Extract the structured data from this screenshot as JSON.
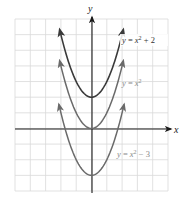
{
  "chart_data": {
    "type": "line",
    "title": "",
    "xlabel": "x",
    "ylabel": "y",
    "xlim": [
      -5,
      5
    ],
    "ylim": [
      -4,
      7
    ],
    "grid": true,
    "grid_step": 1,
    "legend_position": "inline labels right of curves",
    "series": [
      {
        "name": "y = x^2 + 2",
        "label": "y = x² + 2",
        "formula": "x^2 + 2",
        "shift": 2,
        "x_range": [
          -2.07,
          2.07
        ],
        "vertex": [
          0,
          2
        ],
        "color": "#3a3a3a",
        "label_color": "#333333",
        "x": [
          -2,
          -1.5,
          -1,
          -0.5,
          0,
          0.5,
          1,
          1.5,
          2
        ],
        "values": [
          6,
          4.25,
          3,
          2.25,
          2,
          2.25,
          3,
          4.25,
          6
        ]
      },
      {
        "name": "y = x^2",
        "label": "y = x²",
        "formula": "x^2",
        "shift": 0,
        "x_range": [
          -2.07,
          2.07
        ],
        "vertex": [
          0,
          0
        ],
        "color": "#6a6a6a",
        "label_color": "#8a8a8a",
        "x": [
          -2,
          -1.5,
          -1,
          -0.5,
          0,
          0.5,
          1,
          1.5,
          2
        ],
        "values": [
          4,
          2.25,
          1,
          0.25,
          0,
          0.25,
          1,
          2.25,
          4
        ]
      },
      {
        "name": "y = x^2 - 3",
        "label": "y = x² − 3",
        "formula": "x^2 - 3",
        "shift": -3,
        "x_range": [
          -2.12,
          2.12
        ],
        "vertex": [
          0,
          -3
        ],
        "color": "#6a6a6a",
        "label_color": "#8a8a8a",
        "x": [
          -2,
          -1.5,
          -1,
          -0.5,
          0,
          0.5,
          1,
          1.5,
          2
        ],
        "values": [
          1,
          -0.75,
          -2,
          -2.75,
          -3,
          -2.75,
          -2,
          -0.75,
          1
        ]
      }
    ]
  },
  "labels": {
    "x_axis": "x",
    "y_axis": "y",
    "curve_top": {
      "y": "y",
      "eq": " = ",
      "x": "x",
      "exp": "2",
      "tail": " + 2"
    },
    "curve_mid": {
      "y": "y",
      "eq": " = ",
      "x": "x",
      "exp": "2",
      "tail": ""
    },
    "curve_bot": {
      "y": "y",
      "eq": " = ",
      "x": "x",
      "exp": "2",
      "tail": " − 3"
    }
  }
}
